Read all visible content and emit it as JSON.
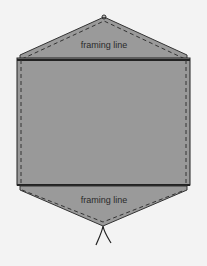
{
  "diagram": {
    "type": "sewing pattern piece (elongated hexagon with framing lines)",
    "colors": {
      "background": "#f3f3f3",
      "fabric": "#999999",
      "outline": "#222222"
    },
    "labels": {
      "top_framing": "framing line",
      "bottom_framing": "framing line"
    }
  }
}
